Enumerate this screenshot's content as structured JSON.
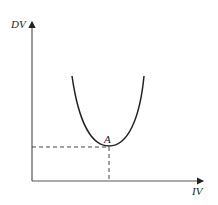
{
  "diagram": {
    "y_axis_label": "DV",
    "x_axis_label": "IV",
    "point_label": "A",
    "curve": "U-shaped (inverted-U complement) curve with minimum at point A",
    "guides": "dashed lines from point A to both axes",
    "colors": {
      "ink": "#222222",
      "dash": "#444444",
      "background": "#ffffff"
    }
  }
}
